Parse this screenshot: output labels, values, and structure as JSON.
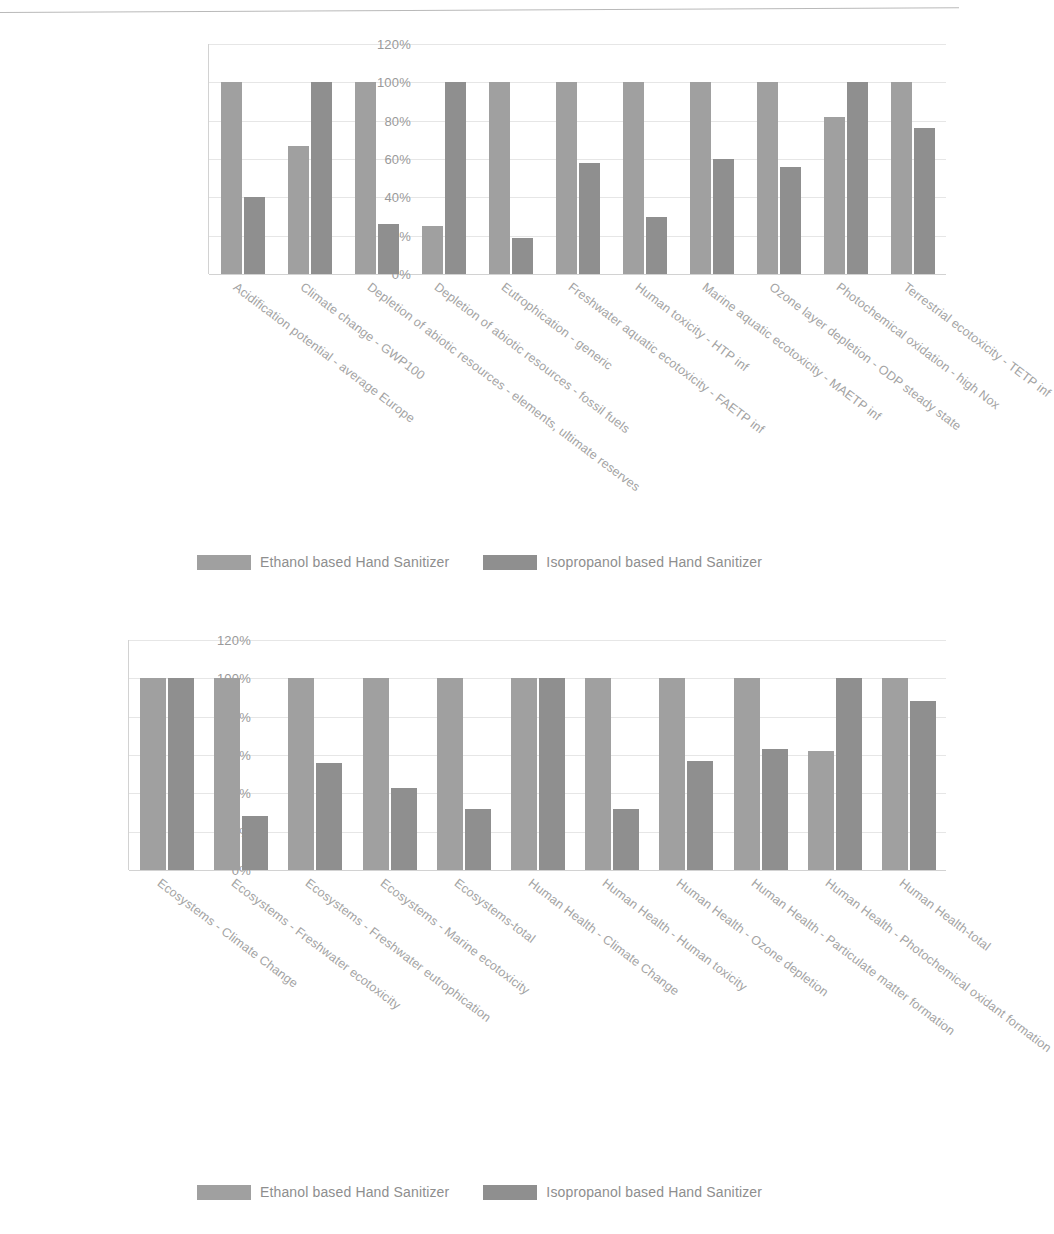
{
  "page": {
    "top_ghost_text": "scanned page header"
  },
  "legend": {
    "series": [
      {
        "label": "Ethanol based Hand Sanitizer",
        "color": "#a0a0a0"
      },
      {
        "label": "Isopropanol based Hand Sanitizer",
        "color": "#8f8f8f"
      }
    ]
  },
  "chart_data": [
    {
      "type": "bar",
      "title": "",
      "xlabel": "",
      "ylabel": "",
      "ylim": [
        0,
        120
      ],
      "yticks": [
        "0%",
        "20%",
        "40%",
        "60%",
        "80%",
        "100%",
        "120%"
      ],
      "ytick_values": [
        0,
        20,
        40,
        60,
        80,
        100,
        120
      ],
      "grid": true,
      "legend_position": "bottom",
      "categories": [
        "Acidification potential - average Europe",
        "Climate change - GWP100",
        "Depletion of abiotic resources - elements, ultimate reserves",
        "Depletion of abiotic resources - fossil fuels",
        "Eutrophication - generic",
        "Freshwater aquatic ecotoxicity - FAETP inf",
        "Human toxicity - HTP inf",
        "Marine aquatic ecotoxicity - MAETP inf",
        "Ozone layer depletion - ODP steady state",
        "Photochemical oxidation - high Nox",
        "Terrestrial ecotoxicity - TETP inf"
      ],
      "series": [
        {
          "name": "Ethanol based Hand Sanitizer",
          "values": [
            100,
            67,
            100,
            25,
            100,
            100,
            100,
            100,
            100,
            82,
            100
          ]
        },
        {
          "name": "Isopropanol based Hand Sanitizer",
          "values": [
            40,
            100,
            26,
            100,
            19,
            58,
            30,
            60,
            56,
            100,
            76
          ]
        }
      ]
    },
    {
      "type": "bar",
      "title": "",
      "xlabel": "",
      "ylabel": "",
      "ylim": [
        0,
        120
      ],
      "yticks": [
        "0%",
        "20%",
        "40%",
        "60%",
        "80%",
        "100%",
        "120%"
      ],
      "ytick_values": [
        0,
        20,
        40,
        60,
        80,
        100,
        120
      ],
      "grid": true,
      "legend_position": "bottom",
      "categories": [
        "Ecosystems - Climate Change",
        "Ecosystems - Freshwater ecotoxicity",
        "Ecosystems - Freshwater eutrophication",
        "Ecosystems - Marine ecotoxicity",
        "Ecosystems-total",
        "Human Health - Climate Change",
        "Human Health - Human toxicity",
        "Human Health - Ozone depletion",
        "Human Health - Particulate matter formation",
        "Human Health - Photochemical oxidant formation",
        "Human Health-total"
      ],
      "series": [
        {
          "name": "Ethanol based Hand Sanitizer",
          "values": [
            100,
            100,
            100,
            100,
            100,
            100,
            100,
            100,
            100,
            62,
            100
          ]
        },
        {
          "name": "Isopropanol based Hand Sanitizer",
          "values": [
            100,
            28,
            56,
            43,
            32,
            100,
            32,
            57,
            63,
            100,
            88
          ]
        }
      ]
    }
  ]
}
